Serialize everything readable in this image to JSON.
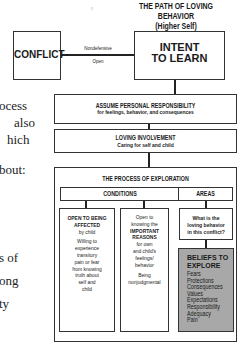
{
  "title": {
    "main": "THE PATH OF LOVING BEHAVIOR",
    "sub": "(Higher Self)"
  },
  "body_text_fragments": [
    "ocess",
    "also",
    "hich",
    "bout:",
    "s   of",
    "ong",
    "ty"
  ],
  "nodes": {
    "conflict": "CONFLICT",
    "intent_line1": "INTENT",
    "intent_line2": "TO LEARN",
    "connector_top": "Nondefensive",
    "connector_bottom": "Open",
    "assume_title": "ASSUME PERSONAL RESPONSIBILITY",
    "assume_sub": "for feelings, behavior, and consequences",
    "loving_title": "LOVING INVOLVEMENT",
    "loving_sub": "Caring for self and child",
    "exploration_title": "THE PROCESS OF EXPLORATION",
    "conditions": "CONDITIONS",
    "areas": "AREAS",
    "open_affected": {
      "line1": "OPEN TO BEING",
      "line2": "AFFECTED",
      "line3": "by child",
      "body": [
        "Willing to",
        "experience",
        "transitory",
        "pain or fear",
        "from knowing",
        "truth about",
        "self and",
        "child"
      ]
    },
    "open_knowing": {
      "pre": [
        "Open to",
        "knowing the"
      ],
      "bold": [
        "IMPORTANT",
        "REASONS"
      ],
      "post": [
        "for own",
        "and child's",
        "feelings/",
        "behavior"
      ],
      "last": [
        "Being",
        "nonjudgmental"
      ]
    },
    "question": [
      "What is the",
      "loving behavior",
      "in this conflict?"
    ],
    "beliefs": {
      "title": [
        "BELIEFS TO",
        "EXPLORE"
      ],
      "items": [
        "Fears",
        "Protections",
        "Consequences",
        "Values",
        "Expectations",
        "Responsibility",
        "Adequacy",
        "Pain"
      ]
    }
  },
  "colors": {
    "line": "#222222",
    "beliefs_fill": "#a8a8a8"
  }
}
